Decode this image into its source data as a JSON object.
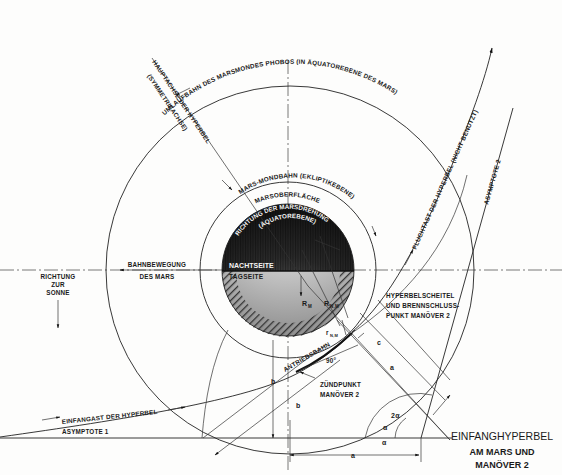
{
  "title": {
    "line1": "EINFANGHYPERBEL",
    "line2": "AM MARS UND",
    "line3": "MANÖVER 2"
  },
  "labels": {
    "phobos_orbit": "UMLAUFBAHN DES MARSMONDES PHOBOS (IN ÄQUATOREBENE DES MARS)",
    "main_axis_1": "HAUPTACHSE DER HYPERBEL",
    "main_axis_2": "(SYMMETRIEACHSE)",
    "escape_branch": "FLUCHTAST DER HYPERBEL (NICHT BENUTZT)",
    "asymptote_2": "ASYMPTOTE 2",
    "asymptote_1": "ASYMPTOTE 1",
    "mars_moon_orbit": "MARS-MONDBAHN (EKLIPTIKEBENE)",
    "mars_surface": "MARSOBERFLÄCHE",
    "rotation_1": "RICHTUNG DER MARSDREHUNG",
    "rotation_2": "(ÄQUATOREBENE)",
    "night_side": "NACHTSEITE",
    "day_side": "TAGSEITE",
    "orbital_motion_1": "BAHNBEWEGUNG",
    "orbital_motion_2": "DES MARS",
    "sun_direction_1": "RICHTUNG",
    "sun_direction_2": "ZUR",
    "sun_direction_3": "SONNE",
    "vertex_1": "HYPERBELSCHEITEL",
    "vertex_2": "UND BRENNSCHLUSS-",
    "vertex_3": "PUNKT MANÖVER 2",
    "propulsion_arc": "ANTRIEBSBAHN",
    "ignition_1": "ZÜNDPUNKT",
    "ignition_2": "MANÖVER 2",
    "capture_branch": "EINFANGAST DER HYPERBEL",
    "right_angle": "90°"
  },
  "symbols": {
    "r_mars": "R",
    "r_mars_sub": "M",
    "r_nm": "R",
    "r_nm_sub": "N,M",
    "r_small": "r",
    "r_small_sub": "N,M",
    "b": "b",
    "a": "a",
    "c": "c",
    "a_diag": "a",
    "b_diag": "b",
    "two_alpha": "2α",
    "alpha_1": "α",
    "alpha_2": "α"
  },
  "colors": {
    "ink": "#1a1a1a",
    "paper": "#fdfdfc",
    "night": "#2a2a2a",
    "day": "#c8c8c8"
  }
}
